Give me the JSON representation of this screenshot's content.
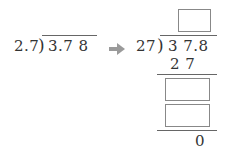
{
  "left_problem": {
    "divisor": "2.7",
    "dividend": "3.7 8"
  },
  "arrow": {
    "icon": "right-arrow-icon",
    "color": "#999999"
  },
  "right_problem": {
    "divisor": "27",
    "dividend": "3 7.8",
    "first_product": "2 7",
    "remainder": "0",
    "answer_boxes": [
      {
        "role": "quotient",
        "value": ""
      },
      {
        "role": "intermediate-1",
        "value": ""
      },
      {
        "role": "intermediate-2",
        "value": ""
      }
    ]
  }
}
